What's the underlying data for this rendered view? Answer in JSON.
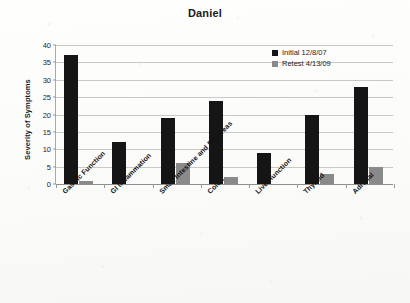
{
  "chart_data": {
    "type": "bar",
    "title": "Daniel",
    "xlabel": "",
    "ylabel": "Severity of Symptoms",
    "ylim": [
      0,
      40
    ],
    "yticks": [
      0,
      5,
      10,
      15,
      20,
      25,
      30,
      35,
      40
    ],
    "grid": true,
    "legend_position": "top-right",
    "categories": [
      "Gastric Function",
      "GI Inflammation",
      "Small Intestine and Pancreas",
      "Colon",
      "Liver function",
      "Thyroid",
      "Adrenal"
    ],
    "series": [
      {
        "name": "Initial 12/8/07",
        "color": "#151515",
        "values": [
          37,
          12,
          19,
          24,
          9,
          20,
          28
        ]
      },
      {
        "name": "Retest 4/13/09",
        "color": "#8a8a8a",
        "values": [
          1,
          0,
          6,
          2,
          0,
          3,
          5
        ]
      }
    ]
  },
  "legend": {
    "items": [
      {
        "label": "Initial 12/8/07",
        "color": "#151515",
        "swatch_icon": "square-swatch-icon"
      },
      {
        "label": "Retest 4/13/09",
        "color": "#8a8a8a",
        "swatch_icon": "square-swatch-icon"
      }
    ]
  }
}
